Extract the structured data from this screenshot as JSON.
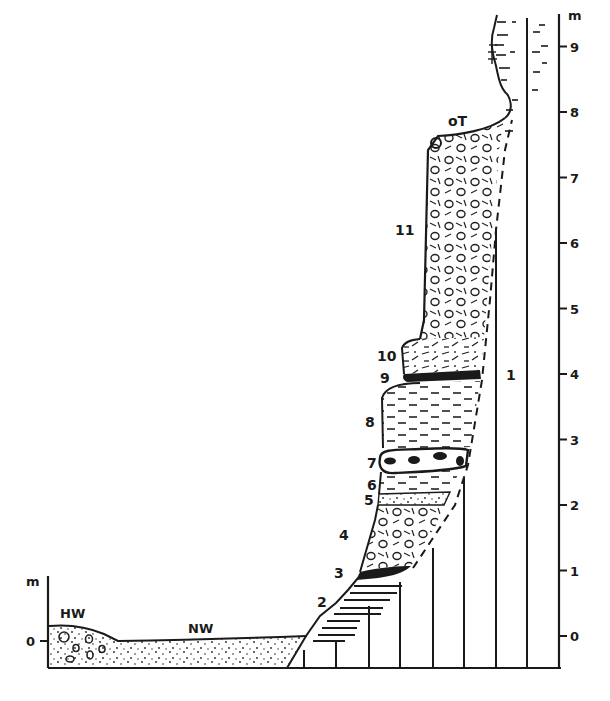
{
  "figure": {
    "type": "geological-profile",
    "scale_unit": "m",
    "right_scale_ticks": [
      "0",
      "1",
      "2",
      "3",
      "4",
      "5",
      "6",
      "7",
      "8",
      "9"
    ],
    "left_scale_unit": "m",
    "left_scale_ticks": [
      "0"
    ],
    "water_labels": {
      "high_water": "HW",
      "normal_water": "NW"
    },
    "top_label": "oT",
    "layers": [
      {
        "id": "1",
        "label": "1"
      },
      {
        "id": "2",
        "label": "2"
      },
      {
        "id": "3",
        "label": "3"
      },
      {
        "id": "4",
        "label": "4"
      },
      {
        "id": "5",
        "label": "5"
      },
      {
        "id": "6",
        "label": "6"
      },
      {
        "id": "7",
        "label": "7"
      },
      {
        "id": "8",
        "label": "8"
      },
      {
        "id": "9",
        "label": "9"
      },
      {
        "id": "10",
        "label": "10"
      },
      {
        "id": "11",
        "label": "11"
      }
    ]
  }
}
